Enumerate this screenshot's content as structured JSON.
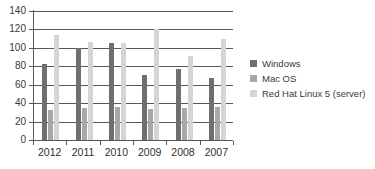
{
  "chart_data": {
    "type": "bar",
    "title": "",
    "subtitle": "",
    "xlabel": "",
    "ylabel": "",
    "categories": [
      "2012",
      "2011",
      "2010",
      "2009",
      "2008",
      "2007"
    ],
    "series": [
      {
        "name": "Windows",
        "color": "#6f6f72",
        "values": [
          82,
          100,
          105,
          71,
          77,
          67
        ]
      },
      {
        "name": "Mac OS",
        "color": "#a8a8ab",
        "values": [
          33,
          35,
          36,
          34,
          35,
          36
        ]
      },
      {
        "name": "Red Hat Linux 5 (server)",
        "color": "#d5d5d7",
        "values": [
          114,
          106,
          105,
          121,
          91,
          110
        ]
      }
    ],
    "ylim": [
      0,
      140
    ],
    "ytick_values": [
      0,
      20,
      40,
      60,
      80,
      100,
      120,
      140
    ],
    "ytick_labels": [
      "0",
      "20",
      "40",
      "60",
      "80",
      "100",
      "120",
      "140"
    ],
    "grid": true,
    "legend_position": "right",
    "axis_color": "#58585a",
    "background": "#ffffff"
  },
  "legend": {
    "entries": [
      {
        "label": "Windows"
      },
      {
        "label": "Mac OS"
      },
      {
        "label": "Red Hat Linux 5 (server)"
      }
    ]
  }
}
